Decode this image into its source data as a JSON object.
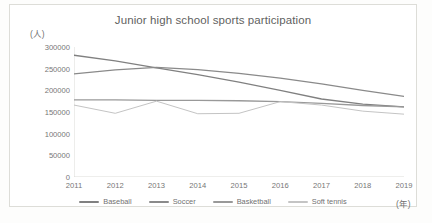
{
  "chart_data": {
    "type": "line",
    "title": "Junior high school sports participation",
    "xlabel": "(年)",
    "ylabel": "(人)",
    "x": [
      2011,
      2012,
      2013,
      2014,
      2015,
      2016,
      2017,
      2018,
      2019
    ],
    "categories": [
      "2011",
      "2012",
      "2013",
      "2014",
      "2015",
      "2016",
      "2017",
      "2018",
      "2019"
    ],
    "yticks": [
      0,
      50000,
      100000,
      150000,
      200000,
      250000,
      300000
    ],
    "ytick_labels": [
      "0",
      "50000",
      "100000",
      "150000",
      "200000",
      "250000",
      "300000"
    ],
    "ylim": [
      0,
      300000
    ],
    "grid": false,
    "legend_position": "bottom",
    "series": [
      {
        "name": "Baseball",
        "color": "#808080",
        "values": [
          281000,
          268000,
          252000,
          236000,
          219000,
          200000,
          180000,
          168000,
          162000
        ]
      },
      {
        "name": "Soccer",
        "color": "#8a8a8a",
        "values": [
          238000,
          247000,
          253000,
          248000,
          239000,
          228000,
          215000,
          200000,
          186000
        ]
      },
      {
        "name": "Basketball",
        "color": "#999999",
        "values": [
          178000,
          178000,
          177000,
          177000,
          176000,
          174000,
          170000,
          165000,
          162000
        ]
      },
      {
        "name": "Soft tennis",
        "color": "#c4c4c4",
        "values": [
          166000,
          147000,
          175000,
          146000,
          147000,
          174000,
          166000,
          152000,
          145000
        ]
      }
    ]
  }
}
